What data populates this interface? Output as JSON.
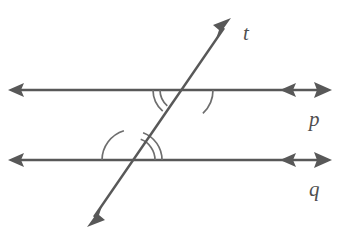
{
  "figure": {
    "background_color": "#ffffff",
    "stroke_color": "#585858",
    "arc_color": "#6a6a6a",
    "label_color": "#4f4f4f",
    "stroke_width": 2.4,
    "arc_stroke_width": 1.6,
    "width": 338,
    "height": 232
  },
  "labels": {
    "transversal": "t",
    "line_top": "p",
    "line_bottom": "q"
  },
  "label_positions": {
    "transversal": {
      "x": 243,
      "y": 40
    },
    "line_top": {
      "x": 309,
      "y": 126
    },
    "line_bottom": {
      "x": 309,
      "y": 196
    }
  },
  "lines": [
    {
      "name": "line-p",
      "label": "p",
      "role": "parallel-line-upper",
      "y": 90,
      "x1": 10,
      "x2": 332,
      "arrow_start": "left",
      "arrow_end": "right",
      "double_arrow_right": true,
      "inner_arrow_x": 288
    },
    {
      "name": "line-q",
      "label": "q",
      "role": "parallel-line-lower",
      "y": 160,
      "x1": 10,
      "x2": 332,
      "arrow_start": "left",
      "arrow_end": "right",
      "double_arrow_right": true,
      "inner_arrow_x": 288
    },
    {
      "name": "line-t",
      "label": "t",
      "role": "transversal",
      "x1": 88,
      "y1": 226,
      "x2": 230,
      "y2": 19,
      "arrow_start": "down-left",
      "arrow_end": "up-right"
    }
  ],
  "intersections": [
    {
      "name": "intersection-upper",
      "on_line": "p",
      "x": 181,
      "y": 90
    },
    {
      "name": "intersection-lower",
      "on_line": "q",
      "x": 133,
      "y": 160
    }
  ],
  "angle_marks": [
    {
      "name": "angle-arc-upper-left-double-outer",
      "intersection": "intersection-upper",
      "position": "below-left",
      "radius": 28,
      "arcs": 2
    },
    {
      "name": "angle-arc-upper-left-double-inner",
      "intersection": "intersection-upper",
      "position": "below-left",
      "radius": 21,
      "arcs": 2
    },
    {
      "name": "angle-arc-upper-right-single",
      "intersection": "intersection-upper",
      "position": "below-right",
      "radius": 32,
      "arcs": 1
    },
    {
      "name": "angle-arc-lower-left-single",
      "intersection": "intersection-lower",
      "position": "above-left",
      "radius": 31,
      "arcs": 1
    },
    {
      "name": "angle-arc-lower-right-double-outer",
      "intersection": "intersection-lower",
      "position": "above-right",
      "radius": 29,
      "arcs": 2
    },
    {
      "name": "angle-arc-lower-right-double-inner",
      "intersection": "intersection-lower",
      "position": "above-right",
      "radius": 22,
      "arcs": 2
    }
  ]
}
